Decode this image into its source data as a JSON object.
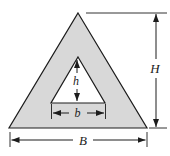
{
  "figure": {
    "kind": "dimensioned-cross-section-diagram",
    "labels": {
      "outer_height": "H",
      "inner_height": "h",
      "inner_base": "b",
      "outer_base": "B"
    },
    "colors": {
      "fill": "#d8d8d8",
      "hole": "#ffffff",
      "line": "#1c1c1c",
      "background": "#ffffff"
    }
  }
}
